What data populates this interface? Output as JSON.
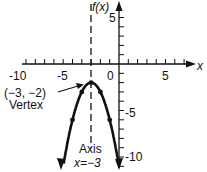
{
  "chart_data": {
    "type": "line",
    "title": "",
    "function": "f(x) = -(x+3)^2 - 2",
    "xlabel": "x",
    "ylabel": "f(x)",
    "xlim": [
      -11,
      8
    ],
    "ylim": [
      -11,
      6.5
    ],
    "x_tick_labels": [
      "-10",
      "-5",
      "0",
      "5"
    ],
    "y_tick_labels": [
      "5",
      "-5",
      "-10"
    ],
    "grid": false,
    "series": [
      {
        "name": "parabola",
        "points": [
          [
            -6,
            -11
          ],
          [
            -5,
            -6
          ],
          [
            -4,
            -3
          ],
          [
            -3,
            -2
          ],
          [
            -2,
            -3
          ],
          [
            -1,
            -6
          ],
          [
            0,
            -11
          ]
        ]
      }
    ],
    "annotations": {
      "vertex_coords": "(−3, −2)",
      "vertex_label": "Vertex",
      "axis_label": "Axis",
      "axis_equation": "x=−3"
    }
  }
}
